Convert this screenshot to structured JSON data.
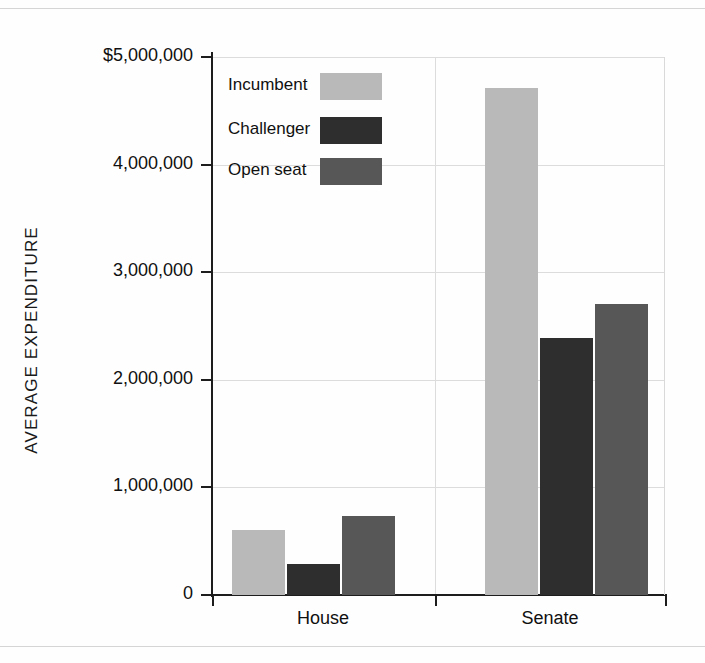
{
  "figure": {
    "background_color": "#fefefe",
    "axis_color": "#1d1d1d",
    "gridline_color": "#dcdcdc"
  },
  "axis": {
    "y_title": "AVERAGE EXPENDITURE"
  },
  "legend": {
    "entries": [
      {
        "label": "Incumbent",
        "color": "#b9b9b9"
      },
      {
        "label": "Challenger",
        "color": "#2e2e2e"
      },
      {
        "label": "Open seat",
        "color": "#575757"
      }
    ]
  },
  "chart_data": {
    "type": "bar",
    "title": "",
    "xlabel": "",
    "ylabel": "AVERAGE EXPENDITURE",
    "categories": [
      "House",
      "Senate"
    ],
    "ytick_labels": [
      "$5,000,000",
      "4,000,000",
      "3,000,000",
      "2,000,000",
      "1,000,000",
      "0"
    ],
    "ytick_values": [
      5000000,
      4000000,
      3000000,
      2000000,
      1000000,
      0
    ],
    "ylim": [
      0,
      5000000
    ],
    "grid": true,
    "legend_position": "upper-left-inside",
    "series": [
      {
        "name": "Incumbent",
        "color": "#b9b9b9",
        "values": [
          600000,
          4710000
        ]
      },
      {
        "name": "Challenger",
        "color": "#2e2e2e",
        "values": [
          290000,
          2390000
        ]
      },
      {
        "name": "Open seat",
        "color": "#575757",
        "values": [
          730000,
          2700000
        ]
      }
    ]
  }
}
